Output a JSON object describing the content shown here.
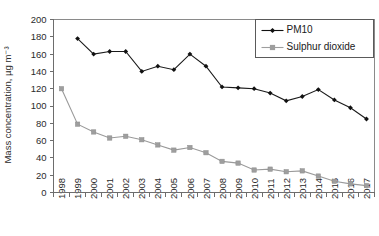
{
  "chart_data": {
    "type": "line",
    "title": "",
    "xlabel": "",
    "ylabel": "Mass concentration, µg m⁻³",
    "ylim": [
      0,
      200
    ],
    "yticks": [
      0,
      20,
      40,
      60,
      80,
      100,
      120,
      140,
      160,
      180,
      200
    ],
    "ytick_labels": [
      "0",
      "20",
      "40",
      "60",
      "80",
      "100",
      "120",
      "140",
      "160",
      "180",
      "200"
    ],
    "grid": false,
    "legend_position": "top-right",
    "categories": [
      "1998",
      "1999",
      "2000",
      "2001",
      "2002",
      "2003",
      "2004",
      "2005",
      "2006",
      "2007",
      "2008",
      "2009",
      "2010",
      "2011",
      "2012",
      "2013",
      "2014",
      "2015",
      "2016",
      "2017"
    ],
    "series": [
      {
        "name": "PM10",
        "color": "#111111",
        "marker": "diamond",
        "values": [
          null,
          178,
          160,
          163,
          163,
          140,
          146,
          142,
          160,
          146,
          122,
          121,
          120,
          115,
          106,
          111,
          119,
          107,
          98,
          85
        ]
      },
      {
        "name": "Sulphur dioxide",
        "color": "#9e9e9e",
        "marker": "square",
        "values": [
          120,
          79,
          70,
          63,
          65,
          61,
          55,
          49,
          52,
          46,
          36,
          34,
          26,
          27,
          24,
          25,
          19,
          13,
          10,
          8
        ]
      }
    ]
  },
  "legend": {
    "items": [
      {
        "label": "PM10"
      },
      {
        "label": "Sulphur dioxide"
      }
    ]
  },
  "colors": {
    "pm10": "#111111",
    "so2": "#9e9e9e",
    "axis": "#6d6d6d",
    "frame": "#8a8a8a",
    "text": "#2b2b2b",
    "background": "#ffffff"
  }
}
